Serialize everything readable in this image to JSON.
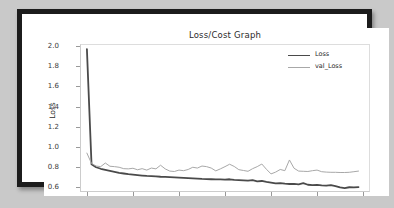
{
  "figure": {
    "title": "Loss/Cost Graph",
    "xlabel": "Epochs",
    "ylabel": "Loss"
  },
  "legend": {
    "items": [
      {
        "label": "Loss",
        "color": "#4a4a4a",
        "width": 1.8
      },
      {
        "label": "val_Loss",
        "color": "#a8a8a8",
        "width": 1.0
      }
    ]
  },
  "axes": {
    "yticks": [
      "2.0",
      "1.8",
      "1.6",
      "1.4",
      "1.2",
      "1.0",
      "0.8",
      "0.6"
    ],
    "ytick_values": [
      2.0,
      1.8,
      1.6,
      1.4,
      1.2,
      1.0,
      0.8,
      0.6
    ],
    "xticks": [
      "0",
      "10",
      "20",
      "30",
      "40",
      "50",
      "60"
    ],
    "xtick_values": [
      0,
      10,
      20,
      30,
      40,
      50,
      60
    ]
  },
  "chart_data": {
    "type": "line",
    "title": "Loss/Cost Graph",
    "xlabel": "Epochs",
    "ylabel": "Loss",
    "xlim": [
      -1.5,
      61.5
    ],
    "ylim": [
      0.555,
      2.02
    ],
    "grid": false,
    "legend_position": "upper right",
    "x": [
      0,
      1,
      2,
      3,
      4,
      5,
      6,
      7,
      8,
      9,
      10,
      11,
      12,
      13,
      14,
      15,
      16,
      17,
      18,
      19,
      20,
      21,
      22,
      23,
      24,
      25,
      26,
      27,
      28,
      29,
      30,
      31,
      32,
      33,
      34,
      35,
      36,
      37,
      38,
      39,
      40,
      41,
      42,
      43,
      44,
      45,
      46,
      47,
      48,
      49,
      50,
      51,
      52,
      53,
      54,
      55,
      56,
      57,
      58,
      59
    ],
    "series": [
      {
        "name": "Loss",
        "color": "#4a4a4a",
        "linewidth": 1.8,
        "values": [
          1.97,
          0.83,
          0.8,
          0.785,
          0.775,
          0.765,
          0.755,
          0.745,
          0.738,
          0.731,
          0.726,
          0.722,
          0.718,
          0.714,
          0.712,
          0.709,
          0.706,
          0.705,
          0.703,
          0.7,
          0.697,
          0.695,
          0.692,
          0.69,
          0.688,
          0.685,
          0.683,
          0.681,
          0.68,
          0.679,
          0.678,
          0.681,
          0.676,
          0.673,
          0.67,
          0.668,
          0.672,
          0.66,
          0.664,
          0.655,
          0.648,
          0.64,
          0.643,
          0.637,
          0.634,
          0.636,
          0.631,
          0.643,
          0.627,
          0.624,
          0.626,
          0.621,
          0.618,
          0.623,
          0.614,
          0.6,
          0.594,
          0.602,
          0.601,
          0.604
        ]
      },
      {
        "name": "val_Loss",
        "color": "#a8a8a8",
        "linewidth": 1.0,
        "values": [
          0.94,
          0.838,
          0.812,
          0.806,
          0.842,
          0.81,
          0.806,
          0.8,
          0.786,
          0.784,
          0.79,
          0.775,
          0.786,
          0.772,
          0.792,
          0.784,
          0.82,
          0.784,
          0.762,
          0.758,
          0.772,
          0.766,
          0.778,
          0.8,
          0.792,
          0.812,
          0.806,
          0.792,
          0.764,
          0.784,
          0.806,
          0.83,
          0.808,
          0.776,
          0.768,
          0.76,
          0.786,
          0.806,
          0.832,
          0.78,
          0.734,
          0.752,
          0.778,
          0.766,
          0.872,
          0.79,
          0.762,
          0.76,
          0.758,
          0.766,
          0.772,
          0.756,
          0.752,
          0.75,
          0.75,
          0.748,
          0.748,
          0.75,
          0.756,
          0.762
        ]
      }
    ]
  }
}
